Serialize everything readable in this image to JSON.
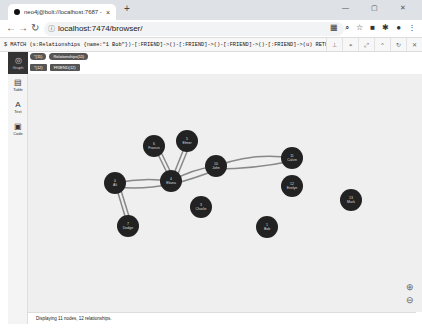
{
  "browser": {
    "tab_title": "neo4j@bolt://localhost:7687 -",
    "url": "localhost:7474/browser/",
    "new_tab": "+",
    "close": "×"
  },
  "editor": {
    "query": "$ MATCH (s:Relationships {name:\"1 Bob\"})-[:FRIEND]->()-[:FRIEND]->()-[:FRIEND]->()-[:FRIEND]->(u) RETURN distinct s;"
  },
  "sidebar": {
    "items": [
      {
        "label": "Graph",
        "icon": "graph-icon"
      },
      {
        "label": "Table",
        "icon": "table-icon"
      },
      {
        "label": "Text",
        "icon": "text-icon"
      },
      {
        "label": "Code",
        "icon": "code-icon"
      }
    ]
  },
  "legend": {
    "nodes_pill": "*(11)",
    "node_label_pill": "Relationships(11)",
    "rels_pill": "*(12)",
    "rel_type_pill": "FRIEND(12)"
  },
  "graph": {
    "nodes": [
      {
        "id": "6",
        "name": "Francis",
        "x": 126,
        "y": 72
      },
      {
        "id": "5",
        "name": "Elmer",
        "x": 159,
        "y": 67
      },
      {
        "id": "4",
        "name": "Eliana",
        "x": 143,
        "y": 107
      },
      {
        "id": "10",
        "name": "John",
        "x": 188,
        "y": 92
      },
      {
        "id": "11",
        "name": "Calvin",
        "x": 264,
        "y": 84
      },
      {
        "id": "0",
        "name": "Ali",
        "x": 87,
        "y": 109
      },
      {
        "id": "12",
        "name": "Evelyn",
        "x": 264,
        "y": 112
      },
      {
        "id": "3",
        "name": "Charlie",
        "x": 173,
        "y": 133
      },
      {
        "id": "7",
        "name": "Dodge",
        "x": 100,
        "y": 152
      },
      {
        "id": "1",
        "name": "Bob",
        "x": 239,
        "y": 153
      },
      {
        "id": "13",
        "name": "Mark",
        "x": 323,
        "y": 126
      }
    ]
  },
  "footer": {
    "status": "Displaying 11 nodes, 12 relationships."
  }
}
